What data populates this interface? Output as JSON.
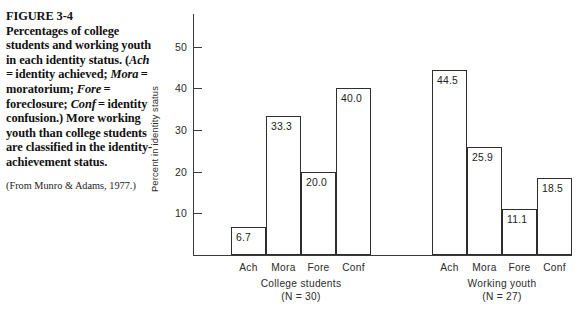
{
  "figure": {
    "number": "FIGURE 3-4",
    "caption_html": "<b>FIGURE 3-4</b><br>Percentages of college students and working youth in each identity status. (<span class=\"it\">Ach</span> = identity achieved; <span class=\"it\">Mora</span> = moratorium; <span class=\"it\">Fore</span> = foreclosure; <span class=\"it\">Conf</span> = identity confusion.) More working youth than college students are classified in the identity-achievement status.",
    "caption_plain": "FIGURE 3-4 Percentages of college students and working youth in each identity status. (Ach = identity achieved; Mora = moratorium; Fore = foreclosure; Conf = identity confusion.) More working youth than college students are classified in the identity-achievement status.",
    "source": "(From Munro & Adams, 1977.)"
  },
  "chart_data": {
    "type": "bar",
    "title": "",
    "xlabel": "",
    "ylabel": "Percent in identity status",
    "ylim": [
      0,
      55
    ],
    "yticks": [
      10,
      20,
      30,
      40,
      50
    ],
    "ytick_labels": [
      "10",
      "20",
      "30",
      "40",
      "50"
    ],
    "grid": false,
    "legend": "none",
    "categories": [
      "Ach",
      "Mora",
      "Fore",
      "Conf"
    ],
    "groups": [
      {
        "name": "College students",
        "n_label": "(N = 30)",
        "n": 30,
        "values": [
          6.7,
          33.3,
          20.0,
          40.0
        ],
        "value_labels": [
          "6.7",
          "33.3",
          "20.0",
          "40.0"
        ]
      },
      {
        "name": "Working youth",
        "n_label": "(N = 27)",
        "n": 27,
        "values": [
          44.5,
          25.9,
          11.1,
          18.5
        ],
        "value_labels": [
          "44.5",
          "25.9",
          "11.1",
          "18.5"
        ]
      }
    ],
    "colors": {
      "bar_fill": "#ffffff",
      "bar_stroke": "#2e2e2e",
      "axis": "#3a3a3a",
      "text": "#1d1d1d",
      "background": "#ffffff"
    }
  }
}
